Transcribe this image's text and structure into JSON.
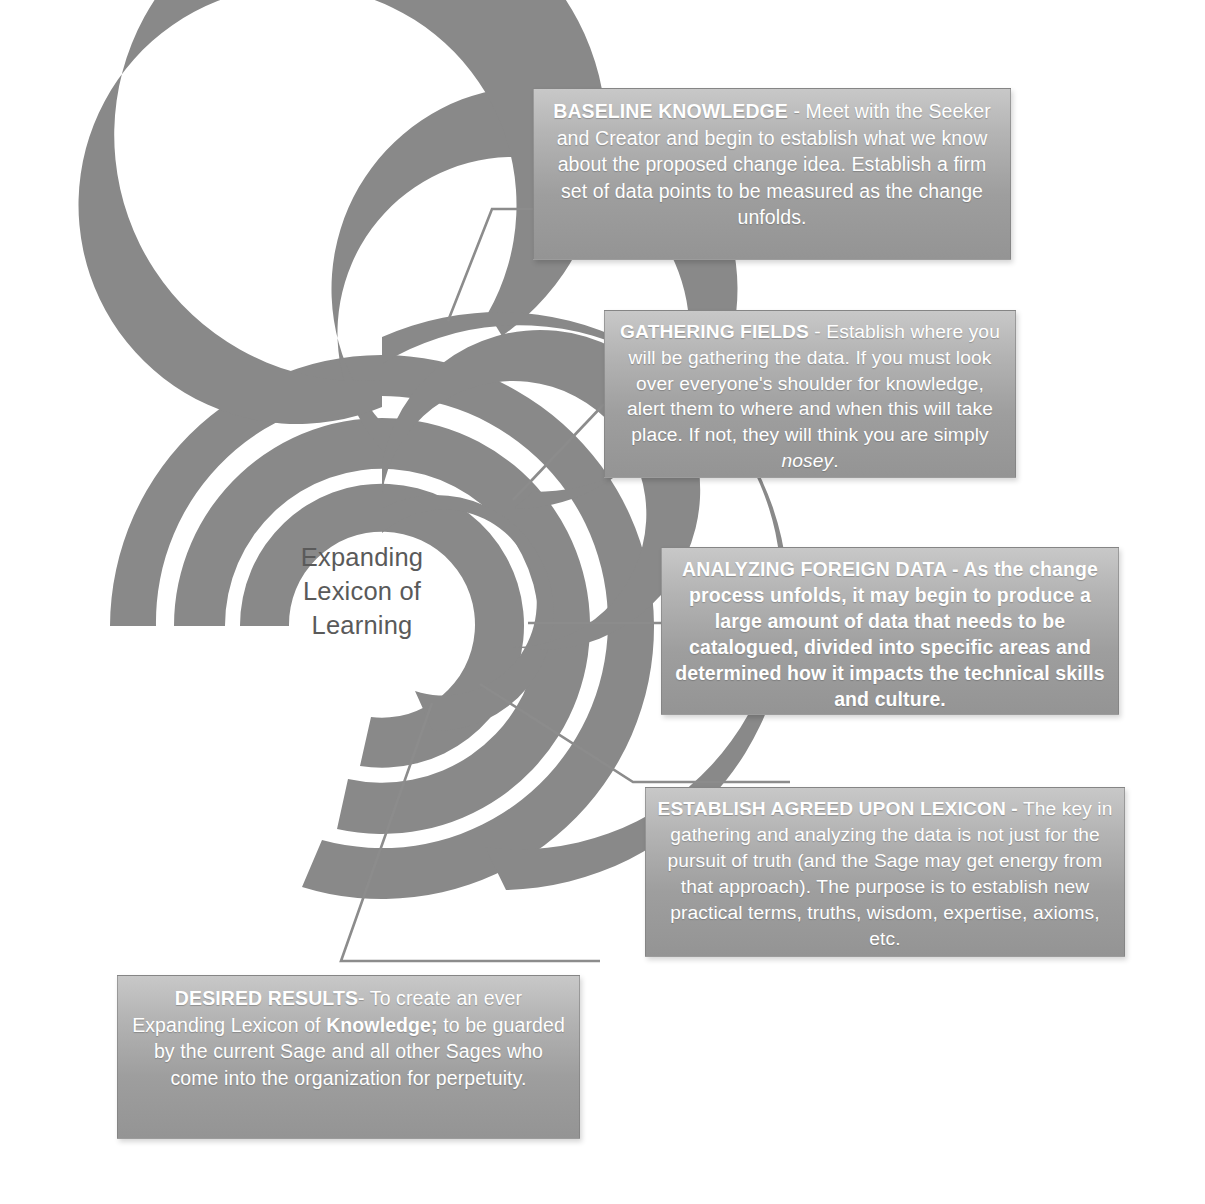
{
  "diagram": {
    "title": "Expanding Lexicon of Learning",
    "center": {
      "lines": [
        "Expanding",
        "Lexicon of",
        "Learning"
      ]
    },
    "colors": {
      "spiral_band": "#898989",
      "box_gradient_top": "#c8c8c8",
      "box_gradient_bottom": "#949494",
      "box_text": "#ffffff",
      "center_text": "#5a5a5a",
      "connector_line": "#8c8c8c",
      "background": "#ffffff"
    },
    "callouts": [
      {
        "id": "baseline-knowledge",
        "heading": "BASELINE KNOWLEDGE",
        "separator": " - ",
        "body": "Meet with the Seeker and Creator and begin to establish what we know about the proposed change idea.  Establish a firm set of data points to be measured as the change unfolds.",
        "emphasis": "none"
      },
      {
        "id": "gathering-fields",
        "heading": "GATHERING FIELDS",
        "separator": " - ",
        "body_pre": "Establish where you will be gathering the data.  If you must look over everyone's shoulder for knowledge, alert them to where and when this will take place. If not, they will think you are simply ",
        "body_italic": "nosey",
        "body_post": ".",
        "emphasis": "italic-tail"
      },
      {
        "id": "analyzing-foreign-data",
        "heading": "ANALYZING FOREIGN DATA",
        "separator": " - ",
        "body": "As the change process unfolds, it may begin to produce a large amount of data that needs to be catalogued, divided into specific areas and determined how it impacts the technical skills and culture.",
        "emphasis": "all-bold"
      },
      {
        "id": "establish-agreed-upon-lexicon",
        "heading": "ESTABLISH AGREED UPON LEXICON -",
        "separator": " ",
        "body": "The key in gathering and analyzing the data is not just for the pursuit of truth (and the Sage may get energy from that approach). The purpose is to establish new practical  terms, truths, wisdom, expertise, axioms, etc.",
        "emphasis": "none"
      },
      {
        "id": "desired-results",
        "heading": "DESIRED RESULTS",
        "separator": "- ",
        "body_pre": "To create an ever Expanding Lexicon of ",
        "body_bold": "Knowledge;",
        "body_post": " to be guarded by the current Sage and all other Sages who come into the organization for perpetuity.",
        "emphasis": "bold-word"
      }
    ]
  }
}
